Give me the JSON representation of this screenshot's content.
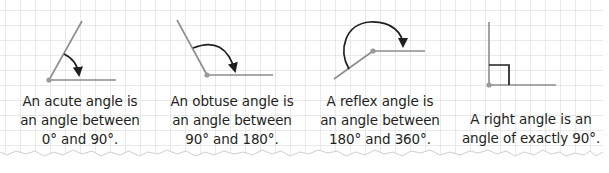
{
  "colors": {
    "paper": "#ffffff",
    "grid": "#d9d9d9",
    "ray": "#8c8c8c",
    "arc": "#231f20",
    "text": "#231f20",
    "vertex": "#9a9a9a",
    "torn_edge_bg": "#ececec"
  },
  "figures": [
    {
      "id": "acute",
      "caption_lines": [
        "An acute angle is",
        "an angle between",
        "0° and 90°."
      ]
    },
    {
      "id": "obtuse",
      "caption_lines": [
        "An obtuse angle is",
        "an angle between",
        "90° and 180°."
      ]
    },
    {
      "id": "reflex",
      "caption_lines": [
        "A reflex angle is",
        "an angle between",
        "180° and 360°."
      ]
    },
    {
      "id": "right",
      "caption_lines": [
        "A right angle is an",
        "angle of exactly 90°."
      ]
    }
  ]
}
